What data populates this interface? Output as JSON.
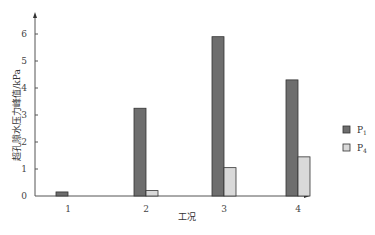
{
  "chart_data": {
    "type": "bar",
    "title": "",
    "xlabel": "工况",
    "ylabel": "超孔隙水压力峰值/kPa",
    "categories": [
      "1",
      "2",
      "3",
      "4"
    ],
    "series": [
      {
        "name": "P1",
        "color": "#6e6e6e",
        "values": [
          0.15,
          3.25,
          5.9,
          4.3
        ]
      },
      {
        "name": "P4",
        "color": "#d9d9d9",
        "values": [
          0,
          0.2,
          1.05,
          1.45
        ]
      }
    ],
    "yticks": [
      0,
      1,
      2,
      3,
      4,
      5,
      6
    ],
    "ylim": [
      0,
      6.6
    ],
    "grid": false,
    "legend_position": "right"
  },
  "legend": {
    "items": [
      {
        "label": "P",
        "sub": "1"
      },
      {
        "label": "P",
        "sub": "4"
      }
    ]
  }
}
